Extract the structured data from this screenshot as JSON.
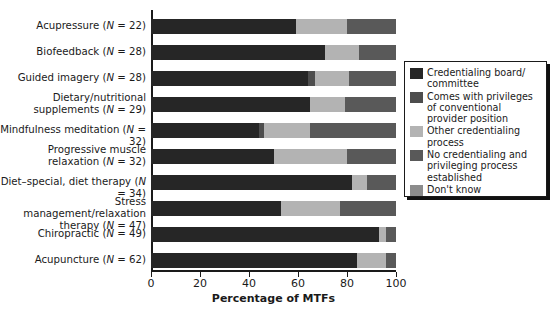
{
  "chart_data": {
    "type": "bar",
    "orientation": "horizontal",
    "stacked": true,
    "title": "",
    "xlabel": "Percentage of MTFs",
    "ylabel": "",
    "xlim": [
      0,
      100
    ],
    "xticks": [
      0,
      20,
      40,
      60,
      80,
      100
    ],
    "grid": false,
    "legend_position": "right",
    "categories": [
      "Acupressure (N = 22)",
      "Biofeedback (N = 28)",
      "Guided imagery (N = 28)",
      "Dietary/nutritional supplements (N = 29)",
      "Mindfulness meditation (N = 32)",
      "Progressive muscle relaxation (N = 32)",
      "Diet–special, diet therapy (N = 34)",
      "Stress management/relaxation therapy (N = 47)",
      "Chiropractic (N = 49)",
      "Acupuncture (N = 62)"
    ],
    "category_lines": [
      [
        "Acupressure (N = 22)"
      ],
      [
        "Biofeedback (N = 28)"
      ],
      [
        "Guided imagery (N = 28)"
      ],
      [
        "Dietary/nutritional",
        "supplements (N = 29)"
      ],
      [
        "Mindfulness meditation (N = 32)"
      ],
      [
        "Progressive muscle",
        "relaxation (N = 32)"
      ],
      [
        "Diet–special, diet therapy (N = 34)"
      ],
      [
        "Stress management/relaxation",
        "therapy (N = 47)"
      ],
      [
        "Chiropractic (N = 49)"
      ],
      [
        "Acupuncture (N = 62)"
      ]
    ],
    "series": [
      {
        "name": "Credentialing board/committee",
        "color": "#262626",
        "values": [
          59,
          71,
          64,
          65,
          44,
          50,
          82,
          53,
          93,
          84
        ]
      },
      {
        "name": "Comes with privileges of conventional provider position",
        "color": "#4d4d4d",
        "values": [
          0,
          0,
          3,
          0,
          2,
          0,
          0,
          0,
          0,
          0
        ]
      },
      {
        "name": "Other credentialing process",
        "color": "#b3b3b3",
        "values": [
          21,
          14,
          14,
          14,
          19,
          30,
          6,
          24,
          3,
          12
        ]
      },
      {
        "name": "No credentialing and privileging process established",
        "color": "#595959",
        "values": [
          20,
          15,
          19,
          21,
          35,
          20,
          12,
          23,
          4,
          4
        ]
      },
      {
        "name": "Don't know",
        "color": "#8c8c8c",
        "values": [
          0,
          0,
          0,
          0,
          0,
          0,
          0,
          0,
          0,
          0
        ]
      }
    ]
  },
  "axis": {
    "x_title": "Percentage of MTFs",
    "tick_labels": [
      "0",
      "20",
      "40",
      "60",
      "80",
      "100"
    ]
  },
  "legend": {
    "items": [
      {
        "color": "#262626",
        "lines": [
          "Credentialing board/",
          "committee"
        ]
      },
      {
        "color": "#4d4d4d",
        "lines": [
          "Comes with privileges",
          "of conventional",
          "provider position"
        ]
      },
      {
        "color": "#b3b3b3",
        "lines": [
          "Other credentialing",
          "process"
        ]
      },
      {
        "color": "#595959",
        "lines": [
          "No credentialing and",
          "privileging process",
          "established"
        ]
      },
      {
        "color": "#8c8c8c",
        "lines": [
          "Don't know"
        ]
      }
    ]
  }
}
